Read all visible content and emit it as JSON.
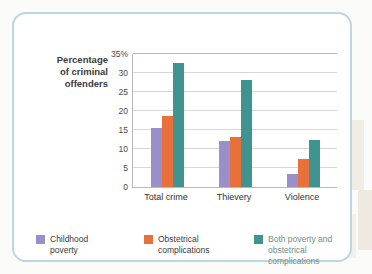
{
  "chart_data": {
    "type": "bar",
    "title": "",
    "xlabel": "",
    "ylabel": "Percentage of criminal offenders",
    "ylabel_lines": [
      "Percentage",
      "of criminal",
      "offenders"
    ],
    "categories": [
      "Total crime",
      "Thievery",
      "Violence"
    ],
    "series": [
      {
        "name": "Childhood poverty",
        "color": "#9b8fc9",
        "values": [
          15.4,
          12.0,
          3.3
        ]
      },
      {
        "name": "Obstetrical complications",
        "color": "#e8703a",
        "values": [
          18.8,
          13.2,
          7.3
        ]
      },
      {
        "name": "Both poverty and obstetrical complications",
        "color": "#3f9490",
        "values": [
          32.7,
          28.1,
          12.5
        ]
      }
    ],
    "ylim": [
      0,
      35
    ],
    "ytick_values": [
      35,
      30,
      25,
      20,
      15,
      10,
      5,
      0
    ],
    "ytick_labels": [
      "35%",
      "30",
      "25",
      "20",
      "15",
      "10",
      "5",
      "0"
    ],
    "grid": true,
    "legend_position": "bottom",
    "legend_entries": [
      {
        "label_lines": [
          "Childhood",
          "poverty"
        ],
        "color": "#9b8fc9"
      },
      {
        "label_lines": [
          "Obstetrical",
          "complications"
        ],
        "color": "#e8703a"
      },
      {
        "label_lines": [
          "Both poverty and",
          "obstetrical complications"
        ],
        "color": "#3f9490"
      }
    ]
  }
}
